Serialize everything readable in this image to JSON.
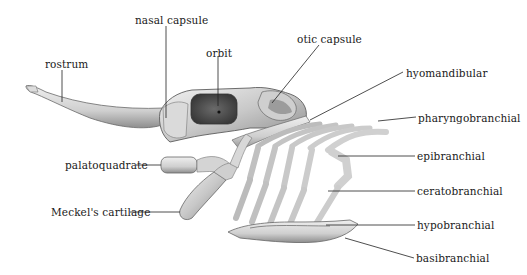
{
  "figure": {
    "labels": {
      "rostrum": "rostrum",
      "nasal_capsule": "nasal capsule",
      "orbit": "orbit",
      "otic_capsule": "otic capsule",
      "hyomandibular": "hyomandibular",
      "pharyngobranchial": "pharyngobranchial",
      "epibranchial": "epibranchial",
      "ceratobranchial": "ceratobranchial",
      "hypobranchial": "hypobranchial",
      "basibranchial": "basibranchial",
      "palatoquadrate": "palatoquadrate",
      "meckels_cartilage": "Meckel's cartilage"
    },
    "colors": {
      "background": "#ffffff",
      "cartilage_light": "#e4e4e4",
      "cartilage_mid": "#bdbdbd",
      "cartilage_dark": "#7a7a7a",
      "orbit_fill": "#4a4a4a",
      "leader_line": "#222222",
      "text": "#1a1a1a"
    }
  }
}
